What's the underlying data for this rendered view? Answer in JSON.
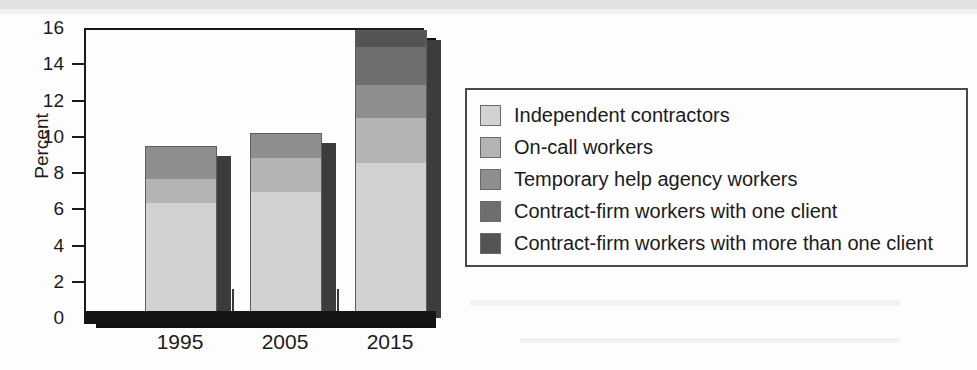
{
  "chart_data": {
    "type": "bar",
    "subtype": "stacked-vertical",
    "title": "",
    "xlabel": "",
    "ylabel": "Percent",
    "categories": [
      "1995",
      "2005",
      "2015"
    ],
    "ylim": [
      0,
      16
    ],
    "ytick_step": 2,
    "yticks": [
      0,
      2,
      4,
      6,
      8,
      10,
      12,
      14,
      16
    ],
    "ytick_labels": [
      "0",
      "2",
      "4",
      "6",
      "8",
      "10",
      "12",
      "14",
      "16"
    ],
    "grid": false,
    "legend_position": "right",
    "series": [
      {
        "name": "Independent contractors",
        "color": "#d2d2d2",
        "values": [
          6.4,
          7.0,
          8.6
        ]
      },
      {
        "name": "On-call workers",
        "color": "#b4b4b4",
        "values": [
          1.3,
          1.9,
          2.5
        ]
      },
      {
        "name": "Temporary help agency workers",
        "color": "#8e8e8e",
        "values": [
          1.8,
          1.3,
          1.8
        ]
      },
      {
        "name": "Contract-firm workers with one client",
        "color": "#6e6e6e",
        "values": [
          0.0,
          0.0,
          2.1
        ]
      },
      {
        "name": "Contract-firm workers with more than one client",
        "color": "#545454",
        "values": [
          0.0,
          0.0,
          0.9
        ]
      }
    ],
    "totals": [
      9.5,
      10.2,
      15.9
    ]
  },
  "axis": {
    "y_title": "Percent",
    "y_tick_labels": [
      "16",
      "14",
      "12",
      "10",
      "8",
      "6",
      "4",
      "2",
      "0"
    ],
    "x_tick_labels": [
      "1995",
      "2005",
      "2015"
    ]
  },
  "legend": {
    "items": [
      {
        "label": "Independent contractors",
        "color": "#d2d2d2"
      },
      {
        "label": "On-call workers",
        "color": "#b4b4b4"
      },
      {
        "label": "Temporary help agency workers",
        "color": "#8e8e8e"
      },
      {
        "label": "Contract-firm workers with one client",
        "color": "#6e6e6e"
      },
      {
        "label": "Contract-firm workers with more than one client",
        "color": "#545454"
      }
    ]
  },
  "colors": {
    "background": "#fdfdfd",
    "axis": "#1a1a1a",
    "baseline": "#151515",
    "bar_side": "#3c3c3c",
    "legend_border": "#4a4a4a"
  }
}
